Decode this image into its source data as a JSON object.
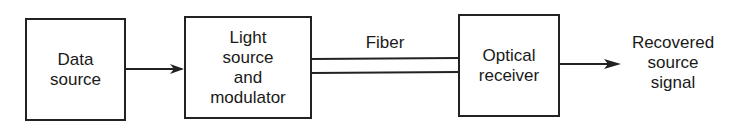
{
  "diagram": {
    "blocks": [
      {
        "id": "data-source",
        "label": "Data\nsource"
      },
      {
        "id": "light-source-modulator",
        "label": "Light\nsource\nand\nmodulator"
      },
      {
        "id": "optical-receiver",
        "label": "Optical\nreceiver"
      }
    ],
    "channel_label": "Fiber",
    "output_label": "Recovered\nsource\nsignal",
    "connections": [
      {
        "from": "data-source",
        "to": "light-source-modulator",
        "type": "arrow"
      },
      {
        "from": "light-source-modulator",
        "to": "optical-receiver",
        "type": "fiber",
        "label": "Fiber"
      },
      {
        "from": "optical-receiver",
        "to": "output",
        "type": "arrow"
      }
    ],
    "colors": {
      "stroke": "#222222",
      "background": "#ffffff"
    }
  }
}
